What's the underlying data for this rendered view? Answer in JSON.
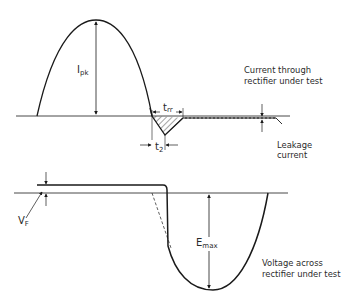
{
  "diagram": {
    "current_waveform": {
      "caption_line1": "Current through",
      "caption_line2": "rectifier under test",
      "peak_label_main": "I",
      "peak_label_sub": "pk",
      "trr_label_main": "t",
      "trr_label_sub": "rr",
      "t2_label_main": "t",
      "t2_label_sub": "2",
      "leakage_line1": "Leakage",
      "leakage_line2": "current"
    },
    "voltage_waveform": {
      "caption_line1": "Voltage across",
      "caption_line2": "rectifier under test",
      "vf_label_main": "V",
      "vf_label_sub": "F",
      "emax_label_main": "E",
      "emax_label_sub": "max"
    },
    "colors": {
      "line": "#1a1a1a",
      "background": "#ffffff"
    }
  }
}
